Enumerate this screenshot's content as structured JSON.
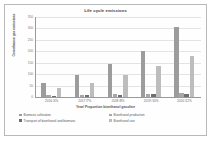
{
  "chart_data": {
    "type": "bar",
    "title": "Life cycle emissions",
    "xlabel": "Year/ Proportion bioethanol gasoline",
    "ylabel": "Greenhouse gas emissions",
    "ylim": [
      0,
      350
    ],
    "yticks": [
      0,
      50,
      100,
      150,
      200,
      250,
      300,
      350
    ],
    "grid": true,
    "legend_position": "bottom",
    "categories": [
      "2016 /4%",
      "2017 /7%",
      "2018 /8%",
      "2019 /10%",
      "2020 /12%"
    ],
    "series": [
      {
        "name": "Biomass cultivation",
        "color": "#9c9c9c",
        "values": [
          62,
          95,
          145,
          200,
          305
        ]
      },
      {
        "name": "Bioethanol production",
        "color": "#a8a8a8",
        "values": [
          8,
          10,
          12,
          14,
          18
        ]
      },
      {
        "name": "Transport of bioethanol and biomass",
        "color": "#6f6f6f",
        "values": [
          6,
          8,
          10,
          12,
          15
        ]
      },
      {
        "name": "Bioethanol use",
        "color": "#bdbdbd",
        "values": [
          40,
          60,
          95,
          135,
          180
        ]
      }
    ]
  },
  "legend": {
    "left_items": [
      "Biomass cultivation",
      "Transport of bioethanol and biomass"
    ],
    "right_items": [
      "Bioethanol production",
      "Bioethanol use"
    ]
  }
}
